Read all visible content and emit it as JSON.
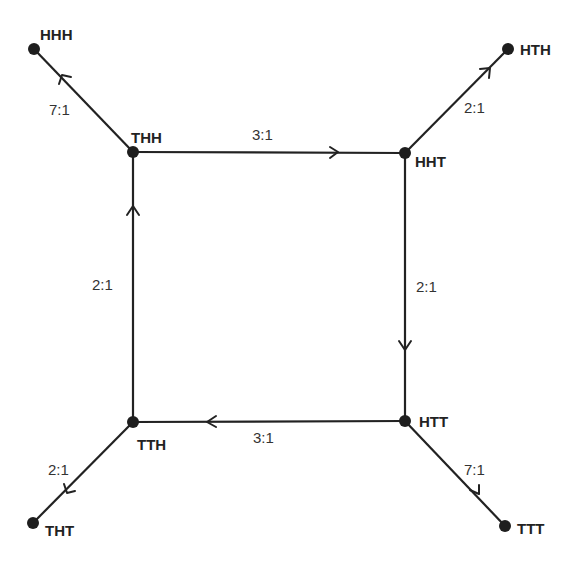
{
  "diagram": {
    "type": "state-transition-graph",
    "nodes": [
      {
        "id": "HHH",
        "label": "HHH",
        "x": 34,
        "y": 49
      },
      {
        "id": "THH",
        "label": "THH",
        "x": 133,
        "y": 152
      },
      {
        "id": "HHT",
        "label": "HHT",
        "x": 405,
        "y": 153
      },
      {
        "id": "HTH",
        "label": "HTH",
        "x": 508,
        "y": 49
      },
      {
        "id": "TTH",
        "label": "TTH",
        "x": 133,
        "y": 422
      },
      {
        "id": "HTT",
        "label": "HTT",
        "x": 405,
        "y": 421
      },
      {
        "id": "THT",
        "label": "THT",
        "x": 33,
        "y": 523
      },
      {
        "id": "TTT",
        "label": "TTT",
        "x": 505,
        "y": 526
      }
    ],
    "edges": [
      {
        "from": "THH",
        "to": "HHH",
        "label": "7:1"
      },
      {
        "from": "THH",
        "to": "HHT",
        "label": "3:1"
      },
      {
        "from": "HHT",
        "to": "HTH",
        "label": "2:1"
      },
      {
        "from": "HHT",
        "to": "HTT",
        "label": "2:1"
      },
      {
        "from": "HTT",
        "to": "TTH",
        "label": "3:1"
      },
      {
        "from": "HTT",
        "to": "TTT",
        "label": "7:1"
      },
      {
        "from": "TTH",
        "to": "THH",
        "label": "2:1"
      },
      {
        "from": "TTH",
        "to": "THT",
        "label": "2:1"
      }
    ]
  }
}
